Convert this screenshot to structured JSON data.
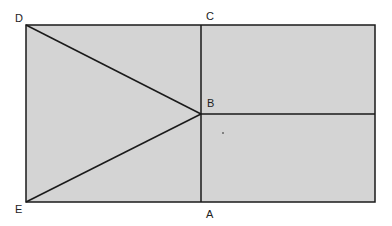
{
  "diagram": {
    "type": "geometry-figure",
    "fill_color": "#d4d4d4",
    "stroke_color": "#1a1a1a",
    "points": {
      "D": {
        "label": "D",
        "x": 26,
        "y": 25
      },
      "C": {
        "label": "C",
        "x": 201,
        "y": 25
      },
      "B": {
        "label": "B",
        "x": 201,
        "y": 114
      },
      "A": {
        "label": "A",
        "x": 201,
        "y": 202
      },
      "E": {
        "label": "E",
        "x": 26,
        "y": 202
      },
      "TR": {
        "x": 375,
        "y": 25
      },
      "BR": {
        "x": 375,
        "y": 202
      },
      "MR": {
        "x": 375,
        "y": 114
      }
    },
    "segments": [
      [
        "D",
        "B"
      ],
      [
        "E",
        "B"
      ],
      [
        "C",
        "A"
      ],
      [
        "B",
        "MR"
      ]
    ],
    "labels": {
      "D": "D",
      "C": "C",
      "B": "B",
      "A": "A",
      "E": "E"
    }
  }
}
